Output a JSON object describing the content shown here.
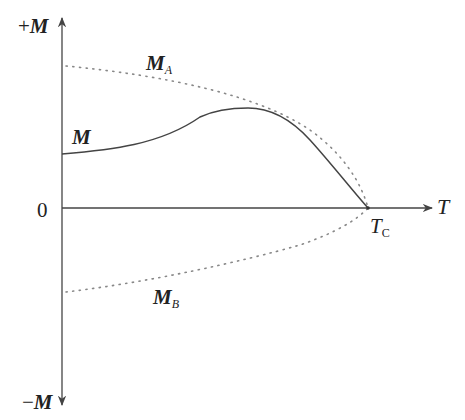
{
  "diagram": {
    "axes": {
      "y_positive_label_sign": "+",
      "y_positive_label_symbol": "M",
      "y_negative_label_sign": "−",
      "y_negative_label_symbol": "M",
      "origin_label": "0",
      "x_label": "T"
    },
    "curves": {
      "m_main": {
        "label": "M",
        "style": "solid"
      },
      "m_a": {
        "label": "M",
        "subscript": "A",
        "style": "dotted"
      },
      "m_b": {
        "label": "M",
        "subscript": "B",
        "style": "dotted"
      }
    },
    "critical_point": {
      "label": "T",
      "subscript": "C"
    },
    "colors": {
      "axis": "#444444",
      "curve": "#444444",
      "dotted": "#888888",
      "text": "#222222"
    }
  }
}
